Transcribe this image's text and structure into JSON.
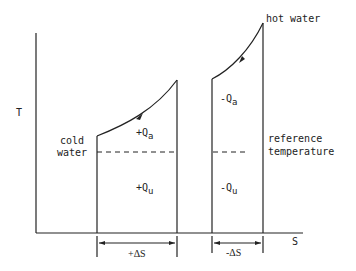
{
  "diagram": {
    "type": "T-S diagram",
    "axes": {
      "y_label": "T",
      "x_label": "S"
    },
    "labels": {
      "hot_water": "hot water",
      "cold_water_1": "cold",
      "cold_water_2": "water",
      "reference_1": "reference",
      "reference_2": "temperature",
      "plus_qa": "+Q",
      "plus_qa_sub": "a",
      "plus_qu": "+Q",
      "plus_qu_sub": "u",
      "minus_qa": "-Q",
      "minus_qa_sub": "a",
      "minus_qu": "-Q",
      "minus_qu_sub": "u",
      "plus_ds": "+ΔS",
      "minus_ds": "-ΔS"
    }
  }
}
